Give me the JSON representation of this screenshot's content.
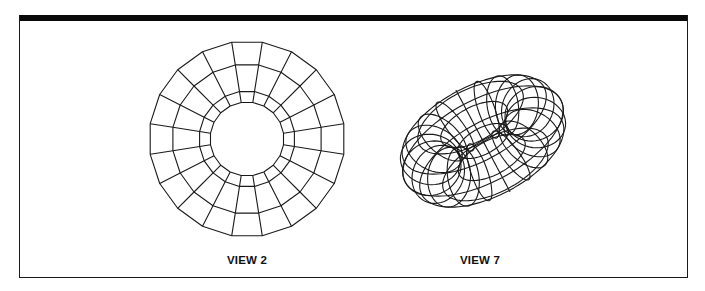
{
  "figure": {
    "colors": {
      "line": "#1a1a1a",
      "rule": "#0a0a0a",
      "background": "#ffffff"
    },
    "views": [
      {
        "id": "view-2",
        "label": "VIEW 2",
        "type": "flat-annulus-top-view",
        "center": [
          247,
          139
        ],
        "ring_radii": [
          37,
          48,
          75,
          98
        ],
        "segments": 20,
        "label_x": 247
      },
      {
        "id": "view-7",
        "label": "VIEW 7",
        "type": "wireframe-torus-oblique-view",
        "center": [
          483,
          141
        ],
        "major_radius": 58,
        "minor_radius": 30,
        "meridians": 20,
        "parallels": 8,
        "tilt_deg": 62,
        "rotation_deg": -28,
        "label_x": 480
      }
    ]
  }
}
